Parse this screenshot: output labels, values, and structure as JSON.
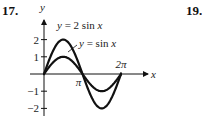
{
  "problem_numbers": {
    "left": "17.",
    "right": "19."
  },
  "chart_data": {
    "type": "line",
    "title": "",
    "xlabel": "x",
    "ylabel": "y",
    "xlim": [
      0,
      6.2832
    ],
    "ylim": [
      -2,
      2
    ],
    "x_ticks": [
      {
        "value": 3.14159,
        "label": "π"
      },
      {
        "value": 6.28318,
        "label": "2π"
      }
    ],
    "y_ticks": [
      {
        "value": 2,
        "label": "2"
      },
      {
        "value": 1,
        "label": "1"
      },
      {
        "value": -1,
        "label": "−1"
      },
      {
        "value": -2,
        "label": "−2"
      }
    ],
    "series": [
      {
        "name": "y = 2 sin x",
        "label_prefix": "y",
        "label_rest": " = 2 sin ",
        "label_var": "x",
        "amplitude": 2,
        "function": "2*sin(x)",
        "domain": [
          0,
          6.28318
        ]
      },
      {
        "name": "y = sin x",
        "label_prefix": "y",
        "label_rest": " = sin ",
        "label_var": "x",
        "amplitude": 1,
        "function": "sin(x)",
        "domain": [
          0,
          6.28318
        ]
      }
    ],
    "grid": false,
    "legend": "inline-labels"
  }
}
